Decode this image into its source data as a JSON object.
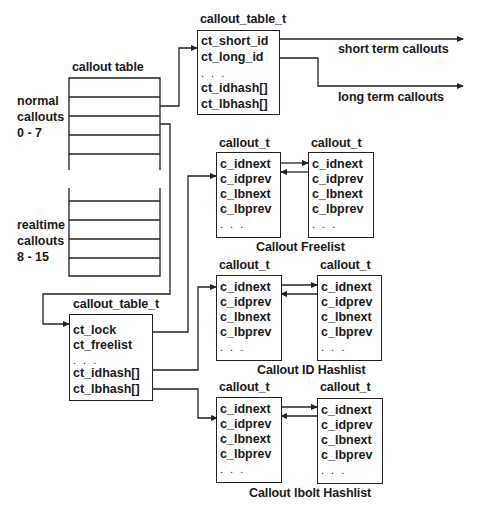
{
  "callout_table_label": "callout table",
  "normal_group": [
    "normal",
    "callouts",
    "0 - 7"
  ],
  "realtime_group": [
    "realtime",
    "callouts",
    "8 - 15"
  ],
  "top_struct": {
    "type_label": "callout_table_t",
    "fields": [
      "ct_short_id",
      "ct_long_id",
      ". . .",
      "ct_idhash[]",
      "ct_lbhash[]"
    ]
  },
  "bottom_struct": {
    "type_label": "callout_table_t",
    "fields": [
      "ct_lock",
      "ct_freelist",
      ". . .",
      "ct_idhash[]",
      "ct_lbhash[]"
    ]
  },
  "arrows": {
    "short_term": "short term callouts",
    "long_term": "long term callouts"
  },
  "callout_fields": [
    "c_idnext",
    "c_idprev",
    "c_lbnext",
    "c_lbprev",
    ". . ."
  ],
  "callout_type_label": "callout_t",
  "lists": [
    {
      "caption": "Callout Freelist"
    },
    {
      "caption": "Callout ID Hashlist"
    },
    {
      "caption": "Callout lbolt Hashlist"
    }
  ]
}
